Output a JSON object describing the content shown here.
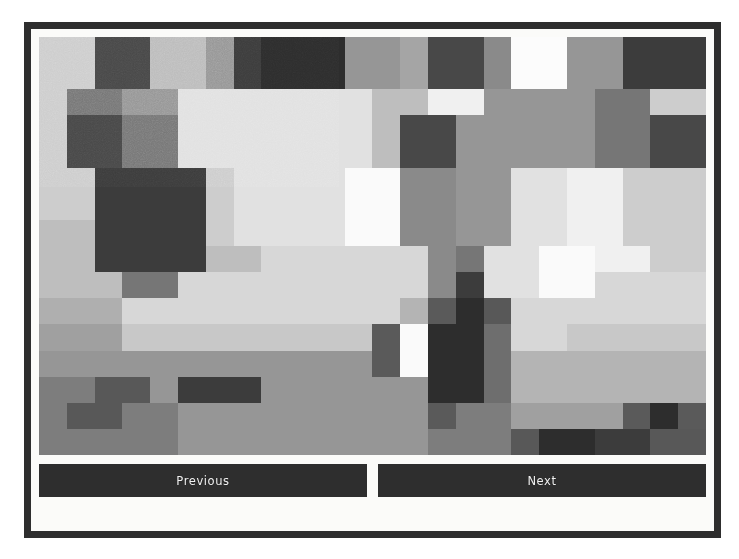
{
  "app": {
    "frame_color": "#2e2e2e",
    "panel_color": "#fbfbf9"
  },
  "viewer": {
    "image_alt": "grayscale-pixelated-image",
    "grid_cols": 24,
    "grid_rows": 16
  },
  "controls": {
    "previous_label": "Previous",
    "next_label": "Next"
  },
  "chart_data": {
    "type": "heatmap",
    "title": "",
    "xlabel": "",
    "ylabel": "",
    "colormap": "grayscale",
    "vmin": 0,
    "vmax": 255,
    "cols": 24,
    "rows": 16,
    "grid": [
      [
        205,
        205,
        72,
        72,
        188,
        188,
        150,
        60,
        45,
        45,
        45,
        150,
        150,
        165,
        72,
        72,
        138,
        252,
        252,
        150,
        150,
        60,
        60,
        60
      ],
      [
        205,
        205,
        72,
        72,
        188,
        188,
        150,
        60,
        45,
        45,
        45,
        150,
        150,
        165,
        72,
        72,
        138,
        252,
        252,
        150,
        150,
        60,
        60,
        60
      ],
      [
        205,
        118,
        118,
        150,
        150,
        225,
        225,
        225,
        225,
        225,
        225,
        225,
        190,
        190,
        240,
        240,
        150,
        150,
        150,
        150,
        118,
        118,
        205,
        205
      ],
      [
        205,
        72,
        72,
        118,
        118,
        225,
        225,
        225,
        225,
        225,
        225,
        225,
        190,
        72,
        72,
        150,
        150,
        150,
        150,
        150,
        118,
        118,
        72,
        72
      ],
      [
        205,
        72,
        72,
        118,
        118,
        225,
        225,
        225,
        225,
        225,
        225,
        225,
        190,
        72,
        72,
        150,
        150,
        150,
        150,
        150,
        118,
        118,
        72,
        72
      ],
      [
        205,
        205,
        60,
        60,
        60,
        60,
        205,
        225,
        225,
        225,
        225,
        250,
        250,
        138,
        138,
        150,
        150,
        225,
        225,
        240,
        240,
        205,
        205,
        205
      ],
      [
        205,
        205,
        60,
        60,
        60,
        60,
        205,
        225,
        225,
        225,
        225,
        250,
        250,
        138,
        138,
        150,
        150,
        225,
        225,
        240,
        240,
        205,
        205,
        205
      ],
      [
        190,
        190,
        60,
        60,
        60,
        60,
        205,
        225,
        225,
        225,
        225,
        250,
        250,
        138,
        138,
        150,
        150,
        225,
        225,
        240,
        240,
        205,
        205,
        205
      ],
      [
        190,
        190,
        60,
        60,
        60,
        60,
        190,
        190,
        215,
        215,
        215,
        215,
        215,
        215,
        138,
        118,
        225,
        225,
        250,
        250,
        240,
        240,
        205,
        205
      ],
      [
        190,
        190,
        190,
        118,
        118,
        215,
        215,
        215,
        215,
        215,
        215,
        215,
        215,
        215,
        138,
        60,
        225,
        225,
        250,
        250,
        215,
        215,
        215,
        215
      ],
      [
        175,
        175,
        175,
        215,
        215,
        215,
        215,
        215,
        215,
        215,
        215,
        215,
        215,
        180,
        90,
        45,
        88,
        215,
        215,
        215,
        215,
        215,
        215,
        215
      ],
      [
        160,
        160,
        160,
        200,
        200,
        200,
        200,
        200,
        200,
        200,
        200,
        200,
        90,
        250,
        45,
        45,
        110,
        215,
        215,
        200,
        200,
        200,
        200,
        200
      ],
      [
        150,
        150,
        150,
        150,
        150,
        150,
        150,
        150,
        150,
        150,
        150,
        150,
        90,
        250,
        45,
        45,
        110,
        180,
        180,
        180,
        180,
        180,
        180,
        180
      ],
      [
        125,
        125,
        88,
        88,
        150,
        60,
        60,
        60,
        150,
        150,
        150,
        150,
        150,
        150,
        45,
        45,
        110,
        180,
        180,
        180,
        180,
        180,
        180,
        180
      ],
      [
        125,
        88,
        88,
        125,
        125,
        150,
        150,
        150,
        150,
        150,
        150,
        150,
        150,
        150,
        90,
        125,
        125,
        160,
        160,
        160,
        160,
        90,
        45,
        90
      ],
      [
        125,
        125,
        125,
        125,
        125,
        150,
        150,
        150,
        150,
        150,
        150,
        150,
        150,
        150,
        125,
        125,
        125,
        88,
        45,
        45,
        60,
        60,
        88,
        88
      ]
    ]
  }
}
